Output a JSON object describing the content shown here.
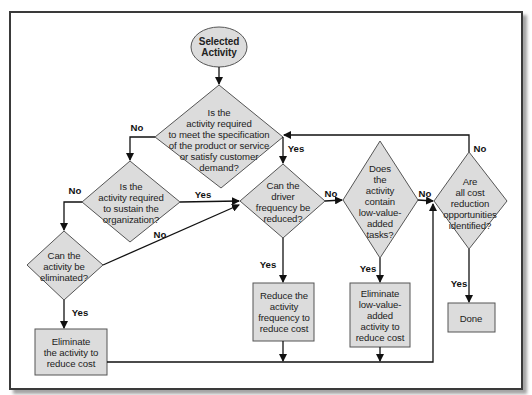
{
  "diagram": {
    "colors": {
      "shape_fill": "#dcdcdc",
      "shape_stroke": "#555555",
      "line": "#111111",
      "frame_border": "#3a3a3a"
    },
    "nodes": [
      {
        "id": "start",
        "type": "ellipse",
        "text": "Selected\nActivity"
      },
      {
        "id": "d1",
        "type": "decision",
        "text": "Is the\nactivity required\nto meet the specification\nof the product or service\nor satisfy customer\ndemand?"
      },
      {
        "id": "d2",
        "type": "decision",
        "text": "Is the\nactivity required\nto sustain the\norganization?"
      },
      {
        "id": "d3",
        "type": "decision",
        "text": "Can the\ndriver\nfrequency be\nreduced?"
      },
      {
        "id": "d4",
        "type": "decision",
        "text": "Does\nthe\nactivity\ncontain\nlow-value-\nadded\ntasks?"
      },
      {
        "id": "d5",
        "type": "decision",
        "text": "Are\nall cost\nreduction\nopportunities\nidentified?"
      },
      {
        "id": "d6",
        "type": "decision",
        "text": "Can the\nactivity be\neliminated?"
      },
      {
        "id": "p1",
        "type": "process",
        "text": "Eliminate\nthe activity to\nreduce cost"
      },
      {
        "id": "p2",
        "type": "process",
        "text": "Reduce the\nactivity\nfrequency to\nreduce cost"
      },
      {
        "id": "p3",
        "type": "process",
        "text": "Eliminate\nlow-value-\nadded\nactivity to\nreduce cost"
      },
      {
        "id": "p4",
        "type": "process",
        "text": "Done"
      }
    ],
    "edge_labels": {
      "d1_no": "No",
      "d1_yes": "Yes",
      "d2_no": "No",
      "d2_yes": "Yes",
      "d6_no": "No",
      "d6_yes": "Yes",
      "d3_no": "No",
      "d3_yes": "Yes",
      "d4_no": "No",
      "d4_yes": "Yes",
      "d5_no": "No",
      "d5_yes": "Yes"
    }
  }
}
